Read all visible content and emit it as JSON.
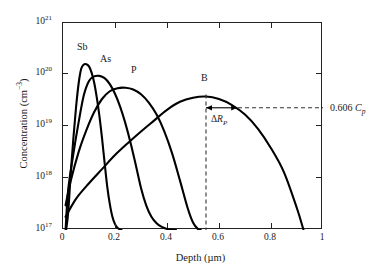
{
  "chart_data": {
    "type": "line",
    "title": "",
    "xlabel": "Depth (µm)",
    "ylabel": "Concentration (cm−3)",
    "ylabel_main": "Concentration (cm",
    "ylabel_exp": "−3",
    "ylabel_tail": ")",
    "xlabel_main": "Depth (µm)",
    "xlim": [
      0,
      1
    ],
    "ylim_log": [
      17,
      21
    ],
    "yscale": "log",
    "grid": false,
    "legend": "inline-curve-labels",
    "xticks": [
      "0",
      "0.2",
      "0.4",
      "0.6",
      "0.8",
      "1"
    ],
    "xtick_values": [
      0,
      0.2,
      0.4,
      0.6,
      0.8,
      1
    ],
    "yticks": [
      {
        "mantissa": "10",
        "exponent": "17",
        "value": 1e+17
      },
      {
        "mantissa": "10",
        "exponent": "18",
        "value": 1e+18
      },
      {
        "mantissa": "10",
        "exponent": "19",
        "value": 1e+19
      },
      {
        "mantissa": "10",
        "exponent": "20",
        "value": 1e+20
      },
      {
        "mantissa": "10",
        "exponent": "21",
        "value": 1e+21
      }
    ],
    "series": [
      {
        "name": "Sb",
        "label": "Sb",
        "label_x_um": 0.085,
        "label_y": 4.2e+20,
        "peak_depth_um": 0.09,
        "peak_concentration": 1.6e+20,
        "straggle_um": 0.038,
        "color": "#000000",
        "points_depth_um": [
          0.012,
          0.02,
          0.03,
          0.04,
          0.05,
          0.06,
          0.07,
          0.08,
          0.09,
          0.1,
          0.11,
          0.12,
          0.13,
          0.14,
          0.15,
          0.16,
          0.17,
          0.18,
          0.19,
          0.2,
          0.21,
          0.22,
          0.225
        ],
        "points_conc": [
          1e+17,
          2.2e+17,
          1.3e+18,
          6e+18,
          2.3e+19,
          6.7e+19,
          1.3e+20,
          1.58e+20,
          1.6e+20,
          1.45e+20,
          1.1e+20,
          7e+19,
          3.6e+19,
          1.6e+19,
          6e+18,
          2e+18,
          7e+17,
          3.2e+17,
          1.8e+17,
          1.3e+17,
          1.1e+17,
          1.02e+17,
          1e+17
        ]
      },
      {
        "name": "As",
        "label": "As",
        "label_x_um": 0.155,
        "label_y": 2.6e+20,
        "peak_depth_um": 0.145,
        "peak_concentration": 9.5e+19,
        "straggle_um": 0.055,
        "color": "#000000",
        "points_depth_um": [
          0.01,
          0.02,
          0.04,
          0.06,
          0.08,
          0.1,
          0.12,
          0.14,
          0.16,
          0.18,
          0.2,
          0.22,
          0.24,
          0.26,
          0.28,
          0.3,
          0.32,
          0.34,
          0.36,
          0.38,
          0.4,
          0.42,
          0.435
        ],
        "points_conc": [
          1e+17,
          6e+17,
          3e+18,
          1.2e+19,
          4e+19,
          7.6e+19,
          9.3e+19,
          9.5e+19,
          8.6e+19,
          6.6e+19,
          4.3e+19,
          2.4e+19,
          1.15e+19,
          4.8e+18,
          1.8e+18,
          6.5e+17,
          3e+17,
          1.8e+17,
          1.35e+17,
          1.15e+17,
          1.05e+17,
          1.01e+17,
          1e+17
        ]
      },
      {
        "name": "P",
        "label": "P",
        "label_x_um": 0.275,
        "label_y": 2e+20,
        "peak_depth_um": 0.255,
        "peak_concentration": 5.6e+19,
        "straggle_um": 0.085,
        "color": "#000000",
        "points_depth_um": [
          0.01,
          0.03,
          0.06,
          0.09,
          0.12,
          0.15,
          0.18,
          0.21,
          0.24,
          0.27,
          0.3,
          0.33,
          0.36,
          0.39,
          0.42,
          0.45,
          0.48,
          0.5,
          0.52,
          0.53
        ],
        "points_conc": [
          3e+17,
          9e+17,
          3.2e+18,
          8.5e+18,
          1.9e+19,
          3.4e+19,
          4.8e+19,
          5.5e+19,
          5.6e+19,
          5.2e+19,
          4.2e+19,
          2.9e+19,
          1.7e+19,
          8e+18,
          3e+18,
          9e+17,
          2.6e+17,
          1.4e+17,
          1.03e+17,
          1e+17
        ]
      },
      {
        "name": "B",
        "label": "B",
        "label_x_um": 0.535,
        "label_y": 1.35e+20,
        "peak_depth_um": 0.55,
        "peak_concentration": 3.8e+19,
        "straggle_um": 0.12,
        "color": "#000000",
        "points_depth_um": [
          0.01,
          0.05,
          0.1,
          0.15,
          0.2,
          0.25,
          0.3,
          0.35,
          0.4,
          0.45,
          0.5,
          0.55,
          0.6,
          0.65,
          0.7,
          0.75,
          0.8,
          0.85,
          0.9,
          0.925
        ],
        "points_conc": [
          1.8e+17,
          4e+17,
          8e+17,
          1.5e+18,
          2.8e+18,
          4.8e+18,
          8e+18,
          1.3e+19,
          2.1e+19,
          3e+19,
          3.6e+19,
          3.8e+19,
          3.4e+19,
          2.6e+19,
          1.7e+19,
          9e+18,
          3.8e+18,
          1.3e+18,
          2.6e+17,
          1e+17
        ]
      }
    ],
    "annotations": [
      {
        "name": "concentration-level-label",
        "text_main": "0.606 ",
        "text_italic": "C",
        "text_sub": "p",
        "full_text": "0.606 Cp",
        "at_concentration": 2.3e+19,
        "kind": "horizontal-dashed-line-to-right-axis"
      },
      {
        "name": "straggle-label",
        "text_symbol": "Δ",
        "text_italic": "R",
        "text_sub": "P",
        "full_text": "ΔRP",
        "kind": "double-ended-arrow-from-peak",
        "from_depth_um": 0.55,
        "to_depth_um": 0.67
      },
      {
        "name": "peak-depth-dashed-line",
        "kind": "vertical-dashed-line",
        "at_depth_um": 0.55
      }
    ]
  }
}
